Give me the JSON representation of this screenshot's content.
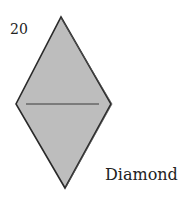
{
  "figure": {
    "number": "20",
    "caption": "Diamond",
    "shape": {
      "type": "diamond",
      "fill": "#bdbdbd",
      "stroke": "#2a2a2a",
      "centerline_color": "#3a3a3a"
    }
  }
}
